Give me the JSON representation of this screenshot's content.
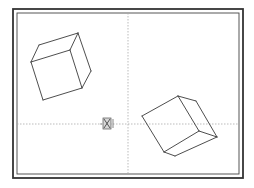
{
  "viewport": {
    "background": "#ffffff",
    "frame": {
      "outer": {
        "x": 13,
        "y": 9,
        "w": 230,
        "h": 169,
        "stroke": "#333333",
        "width": 1.8
      },
      "inner": {
        "x": 17,
        "y": 13,
        "w": 222,
        "h": 161,
        "stroke": "#444444",
        "width": 0.9
      }
    },
    "crosshair": {
      "x": 128,
      "y": 124,
      "color": "#aaaaaa"
    },
    "ucs_icon": {
      "name": "ucs-icon",
      "x": 107,
      "y": 124
    }
  },
  "objects": [
    {
      "name": "cube-1",
      "edges": [
        [
          [
            39,
            45
          ],
          [
            78,
            33
          ]
        ],
        [
          [
            39,
            45
          ],
          [
            31,
            62
          ]
        ],
        [
          [
            78,
            33
          ],
          [
            70,
            50
          ]
        ],
        [
          [
            31,
            62
          ],
          [
            70,
            50
          ]
        ],
        [
          [
            78,
            33
          ],
          [
            91,
            71
          ]
        ],
        [
          [
            70,
            50
          ],
          [
            82,
            88
          ]
        ],
        [
          [
            91,
            71
          ],
          [
            82,
            88
          ]
        ],
        [
          [
            31,
            62
          ],
          [
            43,
            100
          ]
        ],
        [
          [
            43,
            100
          ],
          [
            82,
            88
          ]
        ]
      ]
    },
    {
      "name": "cube-2",
      "edges": [
        [
          [
            178,
            96
          ],
          [
            196,
            101
          ]
        ],
        [
          [
            178,
            96
          ],
          [
            142,
            116
          ]
        ],
        [
          [
            178,
            96
          ],
          [
            199,
            131
          ]
        ],
        [
          [
            196,
            101
          ],
          [
            217,
            137
          ]
        ],
        [
          [
            142,
            116
          ],
          [
            164,
            152
          ]
        ],
        [
          [
            199,
            131
          ],
          [
            217,
            137
          ]
        ],
        [
          [
            199,
            131
          ],
          [
            164,
            152
          ]
        ],
        [
          [
            164,
            152
          ],
          [
            175,
            156
          ]
        ],
        [
          [
            217,
            137
          ],
          [
            175,
            156
          ]
        ]
      ]
    }
  ]
}
